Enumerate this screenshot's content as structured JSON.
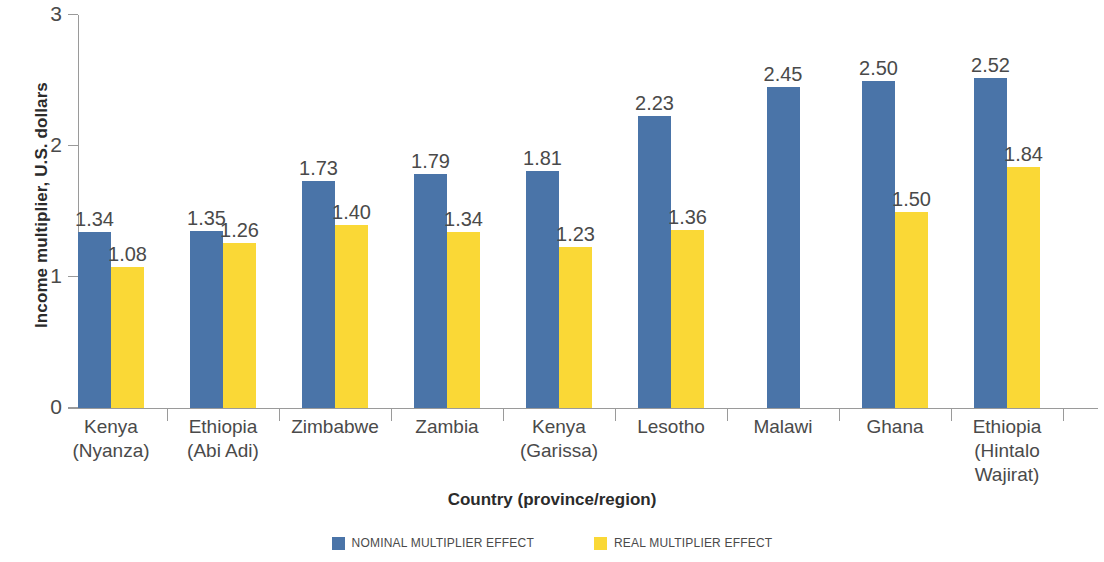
{
  "chart_data": {
    "type": "bar",
    "title": "",
    "xlabel": "Country (province/region)",
    "ylabel": "Income multiplier, U.S. dollars",
    "ylim": [
      0,
      3
    ],
    "yticks": [
      "0",
      "1",
      "2",
      "3"
    ],
    "grid": false,
    "legend_position": "bottom",
    "categories": [
      "Kenya (Nyanza)",
      "Ethiopia (Abi Adi)",
      "Zimbabwe",
      "Zambia",
      "Kenya (Garissa)",
      "Lesotho",
      "Malawi",
      "Ghana",
      "Ethiopia (Hintalo Wajirat)"
    ],
    "category_lines": [
      [
        "Kenya",
        "(Nyanza)"
      ],
      [
        "Ethiopia",
        "(Abi Adi)"
      ],
      [
        "Zimbabwe"
      ],
      [
        "Zambia"
      ],
      [
        "Kenya",
        "(Garissa)"
      ],
      [
        "Lesotho"
      ],
      [
        "Malawi"
      ],
      [
        "Ghana"
      ],
      [
        "Ethiopia",
        "(Hintalo",
        "Wajirat)"
      ]
    ],
    "series": [
      {
        "name": "NOMINAL MULTIPLIER EFFECT",
        "color": "#4a74a8",
        "values": [
          1.34,
          1.35,
          1.73,
          1.79,
          1.81,
          2.23,
          2.45,
          2.5,
          2.52
        ],
        "labels": [
          "1.34",
          "1.35",
          "1.73",
          "1.79",
          "1.81",
          "2.23",
          "2.45",
          "2.50",
          "2.52"
        ]
      },
      {
        "name": "REAL MULTIPLIER EFFECT",
        "color": "#fad836",
        "values": [
          1.08,
          1.26,
          1.4,
          1.34,
          1.23,
          1.36,
          null,
          1.5,
          1.84
        ],
        "labels": [
          "1.08",
          "1.26",
          "1.40",
          "1.34",
          "1.23",
          "1.36",
          "",
          "1.50",
          "1.84"
        ]
      }
    ]
  },
  "legend": {
    "items": [
      {
        "label": "NOMINAL MULTIPLIER EFFECT",
        "color": "#4a74a8"
      },
      {
        "label": "REAL MULTIPLIER EFFECT",
        "color": "#fad836"
      }
    ]
  },
  "axes": {
    "y_title": "Income multiplier, U.S. dollars",
    "x_title": "Country (province/region)"
  }
}
